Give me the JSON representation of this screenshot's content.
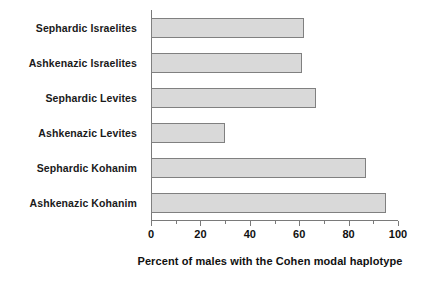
{
  "chart_data": {
    "type": "bar",
    "orientation": "horizontal",
    "title": "",
    "subtitle": "",
    "xlabel": "Percent of males with the Cohen modal haplotype",
    "ylabel": "",
    "categories": [
      "Sephardic Israelites",
      "Ashkenazic Israelites",
      "Sephardic Levites",
      "Ashkenazic Levites",
      "Sephardic Kohanim",
      "Ashkenazic Kohanim"
    ],
    "values": [
      62,
      61,
      67,
      30,
      87,
      95
    ],
    "xlim": [
      0,
      100
    ],
    "ylim": null,
    "xticks": [
      0,
      20,
      40,
      60,
      80,
      100
    ],
    "xtick_labels": [
      "0",
      "20",
      "40",
      "60",
      "80",
      "100"
    ],
    "minor_xticks": [
      10,
      30,
      50,
      70,
      90
    ],
    "grid": false,
    "legend": null,
    "bar_fill_color": "#d9d9d9",
    "bar_edge_color": "#808080",
    "axis_color": "#7a7a7a",
    "text_color": "#111111"
  }
}
